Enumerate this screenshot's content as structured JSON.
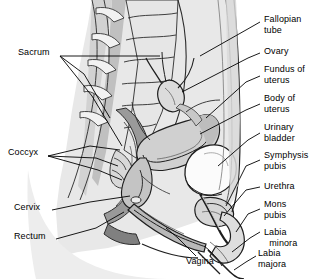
{
  "figure": {
    "background_color": "#ffffff",
    "line_color": "#000000",
    "tissue_colors": {
      "body_silhouette": "#e8e8e8",
      "light_tissue": "#d5d5d5",
      "mid_tissue": "#b4b4b4",
      "dark_tissue": "#8c8c8c",
      "darkest_tissue": "#6e6e6e",
      "bladder_white": "#fbfbfb",
      "bone_light": "#efefef"
    }
  },
  "labels": [
    {
      "id": "sacrum",
      "text": "Sacrum",
      "side": "left",
      "x": 18,
      "y": 52,
      "line1": "Sacrum",
      "line2": ""
    },
    {
      "id": "coccyx",
      "text": "Coccyx",
      "side": "left",
      "x": 8,
      "y": 152,
      "line1": "Coccyx",
      "line2": ""
    },
    {
      "id": "cervix",
      "text": "Cervix",
      "side": "left",
      "x": 14,
      "y": 207,
      "line1": "Cervix",
      "line2": ""
    },
    {
      "id": "rectum",
      "text": "Rectum",
      "side": "left",
      "x": 14,
      "y": 236,
      "line1": "Rectum",
      "line2": ""
    },
    {
      "id": "vagina",
      "text": "Vagina",
      "side": "bottom",
      "x": 186,
      "y": 262,
      "line1": "Vagina",
      "line2": ""
    },
    {
      "id": "fallopian-tube",
      "text": "Fallopian tube",
      "side": "right",
      "x": 264,
      "y": 14,
      "line1": "Fallopian",
      "line2": "tube"
    },
    {
      "id": "ovary",
      "text": "Ovary",
      "side": "right",
      "x": 264,
      "y": 50,
      "line1": "Ovary",
      "line2": ""
    },
    {
      "id": "fundus-of-uterus",
      "text": "Fundus of uterus",
      "side": "right",
      "x": 264,
      "y": 68,
      "line1": "Fundus of",
      "line2": "uterus"
    },
    {
      "id": "body-of-uterus",
      "text": "Body of uterus",
      "side": "right",
      "x": 264,
      "y": 96,
      "line1": "Body of",
      "line2": "uterus"
    },
    {
      "id": "urinary-bladder",
      "text": "Urinary bladder",
      "side": "right",
      "x": 264,
      "y": 125,
      "line1": "Urinary",
      "line2": "bladder"
    },
    {
      "id": "symphysis-pubis",
      "text": "Symphysis pubis",
      "side": "right",
      "x": 264,
      "y": 153,
      "line1": "Symphysis",
      "line2": "pubis"
    },
    {
      "id": "urethra",
      "text": "Urethra",
      "side": "right",
      "x": 264,
      "y": 184,
      "line1": "Urethra",
      "line2": ""
    },
    {
      "id": "mons-pubis",
      "text": "Mons pubis",
      "side": "right",
      "x": 264,
      "y": 202,
      "line1": "Mons",
      "line2": "pubis"
    },
    {
      "id": "labia-minora",
      "text": "Labia minora",
      "side": "right",
      "x": 264,
      "y": 230,
      "line1": "Labia",
      "line2": "  minora"
    },
    {
      "id": "labia-majora",
      "text": "Labia majora",
      "side": "right",
      "x": 258,
      "y": 251,
      "line1": "Labia",
      "line2": "majora"
    }
  ]
}
